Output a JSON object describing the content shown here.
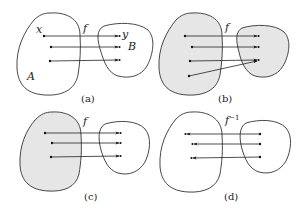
{
  "figure": {
    "panels": [
      {
        "id": "a",
        "caption": "(a)",
        "function_label": "f",
        "domain_label": "A",
        "codomain_label": "B",
        "element_label": "x",
        "image_label": "y",
        "domain_shaded": false,
        "codomain_shaded": false,
        "mappings": [
          {
            "from": "x",
            "to": "y"
          },
          {
            "from": "point-2",
            "to": "image-2"
          },
          {
            "from": "point-3",
            "to": "image-3"
          }
        ]
      },
      {
        "id": "b",
        "caption": "(b)",
        "function_label": "f",
        "domain_shaded": true,
        "codomain_shaded": true,
        "mappings": [
          {
            "from": "point-1",
            "to": "image-1"
          },
          {
            "from": "point-2",
            "to": "image-2"
          },
          {
            "from": "point-3",
            "to": "image-3"
          },
          {
            "from": "point-4",
            "to": "image-3"
          }
        ]
      },
      {
        "id": "c",
        "caption": "(c)",
        "function_label": "f",
        "domain_shaded": true,
        "codomain_shaded": false,
        "mappings": [
          {
            "from": "point-1",
            "to": "image-1"
          },
          {
            "from": "point-2",
            "to": "image-2"
          },
          {
            "from": "point-3",
            "to": "image-3"
          }
        ]
      },
      {
        "id": "d",
        "caption": "(d)",
        "function_label": "f",
        "function_superscript": "−1",
        "domain_shaded": false,
        "codomain_shaded": false,
        "direction": "inverse (B to A)",
        "mappings": [
          {
            "from": "image-1",
            "to": "point-1"
          },
          {
            "from": "image-2",
            "to": "point-2"
          },
          {
            "from": "image-3",
            "to": "point-3"
          }
        ]
      }
    ]
  },
  "colors": {
    "shade": "#e6e6e6",
    "stroke": "#333333",
    "background": "#ffffff"
  }
}
